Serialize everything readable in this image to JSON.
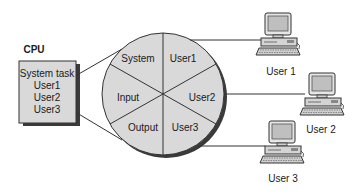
{
  "diagram": {
    "cpu": {
      "title": "CPU",
      "tasks": [
        "System task",
        "User1",
        "User2",
        "User3"
      ]
    },
    "time_slices": {
      "segments": [
        "System",
        "User1",
        "User2",
        "User3",
        "Output",
        "Input"
      ]
    },
    "users": [
      {
        "label": "User 1"
      },
      {
        "label": "User 2"
      },
      {
        "label": "User 3"
      }
    ],
    "colors": {
      "fill": "#d9d9d9",
      "stroke": "#333333",
      "shadow": "#3a3a3a",
      "screen": "#bfbfbf"
    }
  }
}
